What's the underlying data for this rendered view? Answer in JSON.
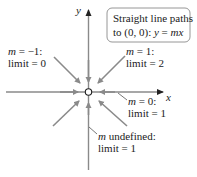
{
  "diagram": {
    "axes": {
      "x_label": "x",
      "y_label": "y"
    },
    "origin_marker": "open-circle",
    "title_box": {
      "line1": "Straight line paths",
      "line2_prefix": "to (0, 0): ",
      "line2_eq_y": "y",
      "line2_eq_eq": " = ",
      "line2_eq_mx": "mx"
    },
    "paths": [
      {
        "name": "slope-neg-one",
        "m_text": "m",
        "m_value": " = −1:",
        "limit_text": "limit = 0"
      },
      {
        "name": "slope-one",
        "m_text": "m",
        "m_value": " = 1:",
        "limit_text": "limit = 2"
      },
      {
        "name": "slope-zero",
        "m_text": "m",
        "m_value": " = 0:",
        "limit_text": "limit = 1"
      },
      {
        "name": "slope-undefined",
        "m_text": "m",
        "m_value": " undefined:",
        "limit_text": "limit = 1"
      }
    ],
    "colors": {
      "arrow": "#8a8a8a",
      "text": "#1a1a1a"
    }
  }
}
